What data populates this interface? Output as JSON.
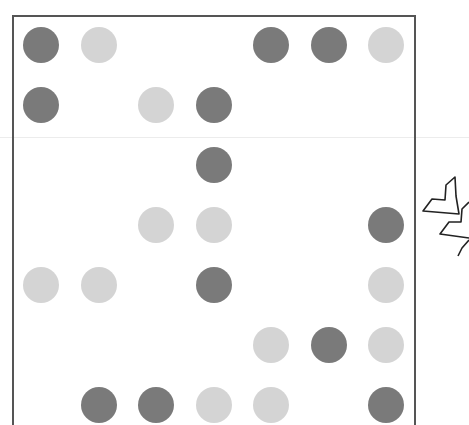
{
  "board": {
    "rows": 7,
    "cols": 7,
    "colors": {
      "dark": "#7a7a7a",
      "light": "#d4d4d4",
      "frame": "#555555"
    },
    "cells": [
      [
        "dark",
        "light",
        "empty",
        "empty",
        "dark",
        "dark",
        "light"
      ],
      [
        "dark",
        "empty",
        "light",
        "dark",
        "empty",
        "empty",
        "empty"
      ],
      [
        "empty",
        "empty",
        "empty",
        "dark",
        "empty",
        "empty",
        "empty"
      ],
      [
        "empty",
        "empty",
        "light",
        "light",
        "empty",
        "empty",
        "dark"
      ],
      [
        "light",
        "light",
        "empty",
        "dark",
        "empty",
        "empty",
        "light"
      ],
      [
        "empty",
        "empty",
        "empty",
        "empty",
        "light",
        "dark",
        "light"
      ],
      [
        "empty",
        "dark",
        "dark",
        "light",
        "light",
        "empty",
        "dark"
      ]
    ]
  },
  "side_icon": {
    "name": "chevron-stack-icon"
  }
}
